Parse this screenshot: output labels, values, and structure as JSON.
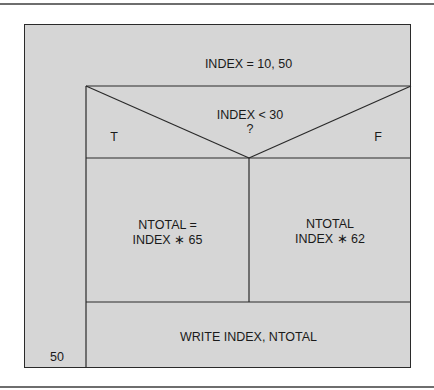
{
  "diagram": {
    "type": "Nassi-Shneiderman structure chart",
    "loop_header": "INDEX = 10, 50",
    "loop_end_label": "50",
    "decision": {
      "condition_line1": "INDEX < 30",
      "condition_line2": "?",
      "true_label": "T",
      "false_label": "F"
    },
    "true_branch": {
      "line1": "NTOTAL =",
      "line2": "INDEX ∗ 65"
    },
    "false_branch": {
      "line1": "NTOTAL",
      "line2": "INDEX ∗ 62"
    },
    "final_statement": "WRITE INDEX, NTOTAL"
  },
  "colors": {
    "fill": "#d6d6d6",
    "line": "#2a2a2a"
  }
}
